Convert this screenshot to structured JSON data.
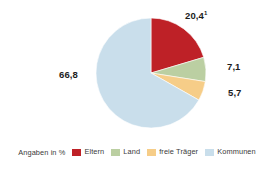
{
  "chart_data": {
    "type": "pie",
    "title": "",
    "unit_caption": "Angaben in %",
    "categories": [
      "Eltern",
      "Land",
      "freie Träger",
      "Kommunen"
    ],
    "values": [
      20.4,
      7.1,
      5.7,
      66.8
    ],
    "value_labels": [
      "20,4",
      "7,1",
      "5,7",
      "66,8"
    ],
    "footnote_markers": [
      "1",
      "",
      "",
      ""
    ],
    "colors": [
      "#BE2127",
      "#BBCFA2",
      "#F6CD88",
      "#C9DEEB"
    ],
    "legend_position": "bottom",
    "grid": false,
    "start_angle_deg": 0,
    "direction": "clockwise"
  },
  "labels": {
    "eltern": {
      "value": "20,4",
      "sup": "1"
    },
    "land": {
      "value": "7,1",
      "sup": ""
    },
    "freie_traeger": {
      "value": "5,7",
      "sup": ""
    },
    "kommunen": {
      "value": "66,8",
      "sup": ""
    }
  },
  "legend": {
    "caption": "Angaben in %",
    "items": [
      {
        "label": "Eltern",
        "color": "#BE2127"
      },
      {
        "label": "Land",
        "color": "#BBCFA2"
      },
      {
        "label": "freie Träger",
        "color": "#F6CD88"
      },
      {
        "label": "Kommunen",
        "color": "#C9DEEB"
      }
    ]
  }
}
